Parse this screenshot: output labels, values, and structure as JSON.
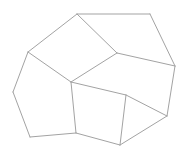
{
  "diagram": {
    "type": "planar-polygon-tessellation",
    "background": "#ffffff",
    "stroke_color": "#a3a3a3",
    "vertices": {
      "A": [
        77,
        14
      ],
      "B": [
        150,
        14
      ],
      "C": [
        175,
        66
      ],
      "D": [
        117,
        53
      ],
      "E": [
        28,
        52
      ],
      "F": [
        71,
        82
      ],
      "G": [
        13,
        92
      ],
      "H": [
        30,
        137
      ],
      "I": [
        76,
        133
      ],
      "J": [
        120,
        145
      ],
      "K": [
        126,
        95
      ],
      "L": [
        167,
        116
      ]
    },
    "edges": [
      [
        "A",
        "B"
      ],
      [
        "B",
        "C"
      ],
      [
        "A",
        "D"
      ],
      [
        "D",
        "C"
      ],
      [
        "A",
        "E"
      ],
      [
        "E",
        "F"
      ],
      [
        "D",
        "F"
      ],
      [
        "E",
        "G"
      ],
      [
        "G",
        "H"
      ],
      [
        "H",
        "I"
      ],
      [
        "F",
        "I"
      ],
      [
        "F",
        "K"
      ],
      [
        "K",
        "J"
      ],
      [
        "I",
        "J"
      ],
      [
        "J",
        "L"
      ],
      [
        "K",
        "L"
      ],
      [
        "C",
        "L"
      ]
    ]
  }
}
